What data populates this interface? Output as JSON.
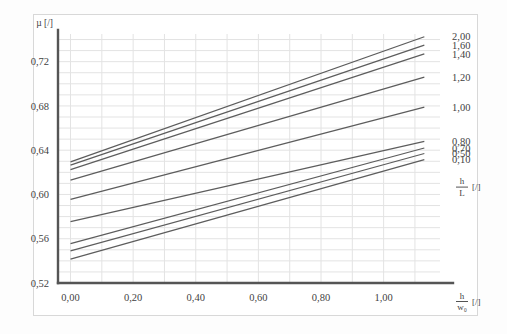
{
  "chart_data": {
    "type": "line",
    "title": "",
    "xlabel": "h/w0 [/]",
    "ylabel": "µ [/]",
    "xlabel_numerator": "h",
    "xlabel_denominator": "w₀",
    "xlabel_unit": "[/]",
    "ylabel_text": "µ [/]",
    "legend_title_numerator": "h",
    "legend_title_denominator": "L",
    "legend_title_unit": "[/]",
    "xlim": [
      -0.04,
      1.18
    ],
    "ylim": [
      0.52,
      0.745
    ],
    "xticks": [
      0.0,
      0.2,
      0.4,
      0.6,
      0.8,
      1.0
    ],
    "xtick_labels": [
      "0,00",
      "0,20",
      "0,40",
      "0,60",
      "0,80",
      "1,00"
    ],
    "yticks": [
      0.52,
      0.56,
      0.6,
      0.64,
      0.68,
      0.72
    ],
    "ytick_labels": [
      "0,52",
      "0,56",
      "0,60",
      "0,64",
      "0,68",
      "0,72"
    ],
    "grid": true,
    "grid_x_step": 0.1,
    "grid_y_step": 0.01,
    "legend_position": "right",
    "x_start": 0.0,
    "x_end": 1.13,
    "series": [
      {
        "name": "2,00",
        "label": "2,00",
        "color": "#5d5d5d",
        "y_start": 0.6295,
        "y_end": 0.7425
      },
      {
        "name": "1,60",
        "label": "1,60",
        "color": "#5d5d5d",
        "y_start": 0.6265,
        "y_end": 0.735
      },
      {
        "name": "1,40",
        "label": "1,40",
        "color": "#5d5d5d",
        "y_start": 0.6225,
        "y_end": 0.727
      },
      {
        "name": "1,20",
        "label": "1,20",
        "color": "#5d5d5d",
        "y_start": 0.613,
        "y_end": 0.706
      },
      {
        "name": "1,00",
        "label": "1,00",
        "color": "#5d5d5d",
        "y_start": 0.5955,
        "y_end": 0.679
      },
      {
        "name": "0,80",
        "label": "0,80",
        "color": "#5d5d5d",
        "y_start": 0.5755,
        "y_end": 0.648
      },
      {
        "name": "0,70",
        "label": "0,70",
        "color": "#5d5d5d",
        "y_start": 0.5555,
        "y_end": 0.642
      },
      {
        "name": "0,50",
        "label": "0,50",
        "color": "#5d5d5d",
        "y_start": 0.549,
        "y_end": 0.637
      },
      {
        "name": "0,10",
        "label": "0,10",
        "color": "#5d5d5d",
        "y_start": 0.5415,
        "y_end": 0.6315
      }
    ]
  }
}
